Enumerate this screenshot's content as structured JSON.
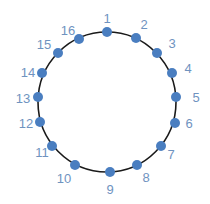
{
  "diagram": {
    "type": "ring-of-nodes",
    "circle": {
      "cx": 107,
      "cy": 102,
      "rx": 69,
      "ry": 70,
      "stroke": "#1a1a1a"
    },
    "node_color": "#4a7ec0",
    "label_color": "#6f93bf",
    "nodes": [
      {
        "label": "1",
        "x": 107,
        "y": 32,
        "lx": 107,
        "ly": 18
      },
      {
        "label": "2",
        "x": 136,
        "y": 38,
        "lx": 144,
        "ly": 24
      },
      {
        "label": "3",
        "x": 157,
        "y": 53,
        "lx": 172,
        "ly": 43
      },
      {
        "label": "4",
        "x": 172,
        "y": 73,
        "lx": 188,
        "ly": 68
      },
      {
        "label": "5",
        "x": 176,
        "y": 97,
        "lx": 196,
        "ly": 97
      },
      {
        "label": "6",
        "x": 175,
        "y": 123,
        "lx": 189,
        "ly": 123
      },
      {
        "label": "7",
        "x": 161,
        "y": 146,
        "lx": 171,
        "ly": 154
      },
      {
        "label": "8",
        "x": 137,
        "y": 165,
        "lx": 146,
        "ly": 177
      },
      {
        "label": "9",
        "x": 110,
        "y": 172,
        "lx": 110,
        "ly": 189
      },
      {
        "label": "10",
        "x": 75,
        "y": 165,
        "lx": 64,
        "ly": 178
      },
      {
        "label": "11",
        "x": 52,
        "y": 146,
        "lx": 42,
        "ly": 152
      },
      {
        "label": "12",
        "x": 40,
        "y": 122,
        "lx": 26,
        "ly": 123
      },
      {
        "label": "13",
        "x": 38,
        "y": 97,
        "lx": 23,
        "ly": 98
      },
      {
        "label": "14",
        "x": 42,
        "y": 73,
        "lx": 28,
        "ly": 72
      },
      {
        "label": "15",
        "x": 58,
        "y": 53,
        "lx": 44,
        "ly": 44
      },
      {
        "label": "16",
        "x": 79,
        "y": 39,
        "lx": 68,
        "ly": 30
      }
    ]
  }
}
